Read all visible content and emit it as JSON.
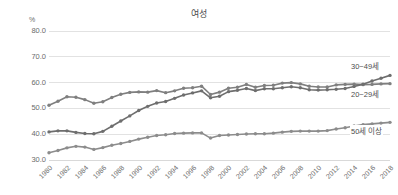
{
  "chart_data": {
    "type": "line",
    "title": "여성",
    "xlabel": "",
    "ylabel": "%",
    "unit_label": "%",
    "ylim": [
      30.0,
      80.0
    ],
    "yticks": [
      "80.0",
      "70.0",
      "60.0",
      "50.0",
      "40.0",
      "30.0"
    ],
    "ytick_values": [
      80.0,
      70.0,
      60.0,
      50.0,
      40.0,
      30.0
    ],
    "grid": true,
    "legend_position": "right-inline",
    "x": [
      1980,
      1981,
      1982,
      1983,
      1984,
      1985,
      1986,
      1987,
      1988,
      1989,
      1990,
      1991,
      1992,
      1993,
      1994,
      1995,
      1996,
      1997,
      1998,
      1999,
      2000,
      2001,
      2002,
      2003,
      2004,
      2005,
      2006,
      2007,
      2008,
      2009,
      2010,
      2011,
      2012,
      2013,
      2014,
      2015,
      2016,
      2017,
      2018
    ],
    "xticks": [
      "1980",
      "1982",
      "1984",
      "1986",
      "1988",
      "1990",
      "1992",
      "1994",
      "1996",
      "1998",
      "2000",
      "2002",
      "2004",
      "2006",
      "2008",
      "2010",
      "2012",
      "2014",
      "2016",
      "2018"
    ],
    "xtick_values": [
      1980,
      1982,
      1984,
      1986,
      1988,
      1990,
      1992,
      1994,
      1996,
      1998,
      2000,
      2002,
      2004,
      2006,
      2008,
      2010,
      2012,
      2014,
      2016,
      2018
    ],
    "series": [
      {
        "name": "20~29세",
        "label": "20~29세",
        "color": "#7f7f7f",
        "values": [
          51.2,
          52.8,
          54.5,
          54.3,
          53.4,
          52.0,
          52.6,
          54.2,
          55.5,
          56.2,
          56.4,
          56.3,
          56.9,
          56.1,
          56.8,
          57.8,
          58.0,
          58.6,
          55.4,
          56.3,
          57.8,
          58.2,
          59.3,
          58.2,
          58.9,
          59.0,
          59.8,
          60.0,
          59.5,
          58.6,
          58.3,
          58.3,
          59.1,
          59.3,
          59.4,
          59.2,
          59.3,
          59.5,
          59.6
        ]
      },
      {
        "name": "30~49세",
        "label": "30~49세",
        "color": "#6e6e6e",
        "values": [
          40.9,
          41.3,
          41.3,
          40.7,
          40.3,
          40.2,
          41.1,
          43.1,
          45.1,
          47.1,
          49.2,
          50.8,
          52.1,
          52.7,
          53.9,
          55.2,
          56.0,
          56.8,
          54.1,
          54.7,
          56.5,
          57.0,
          57.7,
          56.9,
          57.6,
          57.6,
          58.0,
          58.4,
          58.0,
          57.2,
          57.1,
          57.2,
          57.4,
          57.7,
          58.5,
          59.4,
          60.6,
          61.7,
          62.8
        ]
      },
      {
        "name": "50세 이상",
        "label": "50세 이상",
        "color": "#8c8c8c",
        "values": [
          32.8,
          33.7,
          34.7,
          35.3,
          35.0,
          34.1,
          34.8,
          35.7,
          36.4,
          37.2,
          38.1,
          38.8,
          39.5,
          39.8,
          40.3,
          40.4,
          40.5,
          40.5,
          38.5,
          39.5,
          39.7,
          39.9,
          40.1,
          40.2,
          40.2,
          40.4,
          40.8,
          41.1,
          41.2,
          41.2,
          41.2,
          41.4,
          42.0,
          42.5,
          43.2,
          43.7,
          44.0,
          44.3,
          44.6
        ]
      }
    ]
  }
}
